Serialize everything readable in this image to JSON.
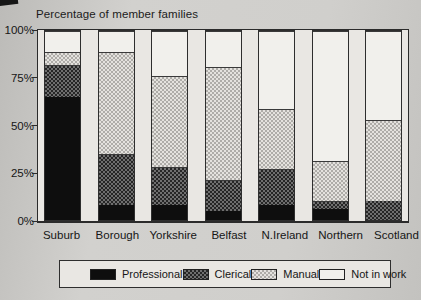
{
  "title": "Percentage of member families",
  "chart_data": {
    "type": "bar",
    "stacked": true,
    "title": "Percentage of member families",
    "xlabel": "",
    "ylabel": "",
    "ylim": [
      0,
      100
    ],
    "grid": false,
    "legend_position": "bottom",
    "categories": [
      "Suburb",
      "Borough",
      "Yorkshire",
      "Belfast",
      "N.Ireland",
      "Northern",
      "Scotland"
    ],
    "series": [
      {
        "name": "Professional",
        "pattern": "solid-black",
        "color": "#0e0e0e",
        "values": [
          65,
          8,
          8,
          5,
          8,
          6,
          0
        ]
      },
      {
        "name": "Clerical",
        "pattern": "checker-dark",
        "color": "#4f4f4f",
        "values": [
          17,
          27,
          20,
          16,
          19,
          4,
          10
        ]
      },
      {
        "name": "Manual",
        "pattern": "checker-light",
        "color": "#c9c7c3",
        "values": [
          7,
          54,
          48,
          60,
          32,
          21,
          43
        ]
      },
      {
        "name": "Not in work",
        "pattern": "white",
        "color": "#f1f0ec",
        "values": [
          11,
          11,
          24,
          19,
          41,
          69,
          47
        ]
      }
    ],
    "yticks": [
      {
        "label": "0%",
        "value": 0
      },
      {
        "label": "25%",
        "value": 25
      },
      {
        "label": "50%",
        "value": 50
      },
      {
        "label": "75%",
        "value": 75
      },
      {
        "label": "100%",
        "value": 100
      }
    ]
  }
}
